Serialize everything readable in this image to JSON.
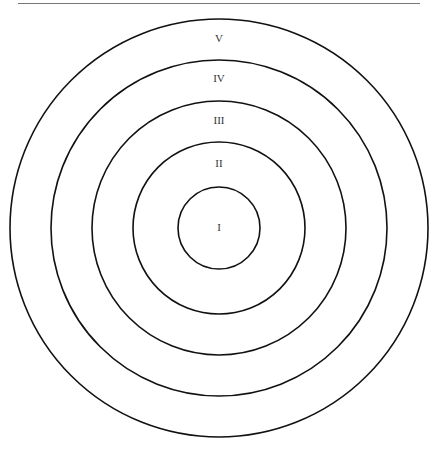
{
  "diagram": {
    "type": "concentric-circles",
    "center": {
      "x": 219,
      "y": 228
    },
    "stroke_color": "#111111",
    "rings": [
      {
        "label": "I",
        "radius": 41,
        "label_y": 231
      },
      {
        "label": "II",
        "radius": 86,
        "label_y": 167
      },
      {
        "label": "III",
        "radius": 127,
        "label_y": 124
      },
      {
        "label": "IV",
        "radius": 168,
        "label_y": 82
      },
      {
        "label": "V",
        "radius": 209,
        "label_y": 42
      }
    ]
  }
}
